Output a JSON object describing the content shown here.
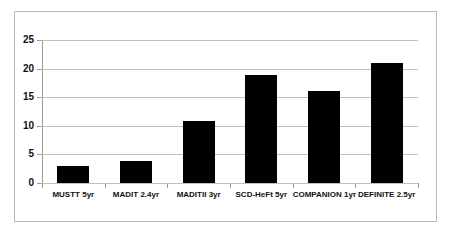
{
  "chart_data": {
    "type": "bar",
    "title": "",
    "subtitle": "",
    "xlabel": "",
    "ylabel": "",
    "categories": [
      "MUSTT 5yr",
      "MADIT 2.4yr",
      "MADITII  3yr",
      "SCD-HeFt 5yr",
      "COMPANION 1yr",
      "DEFINITE 2.5yr"
    ],
    "values": [
      2.9,
      3.8,
      10.9,
      18.9,
      16.0,
      21.0
    ],
    "ylim": [
      0,
      25
    ],
    "yticks": [
      0,
      5,
      10,
      15,
      20,
      25
    ],
    "ytick_labels": [
      "0",
      "5",
      "10",
      "15",
      "20",
      "25"
    ],
    "grid": true,
    "legend": "none",
    "bar_color": "#000000",
    "gridline_color": "#c0c0c0",
    "axis_color": "#9a9a9a",
    "frame_color": "#b8b8b8",
    "background_color": "#ffffff"
  }
}
